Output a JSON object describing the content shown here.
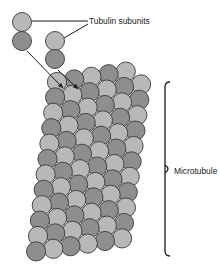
{
  "figure": {
    "title_alt": "Microtubule assembled from tubulin subunits",
    "background": "#ffffff"
  },
  "labels": {
    "tubulin_subunits": "Tubulin subunits",
    "microtubule": "Microtubule"
  },
  "colors": {
    "alpha_subunit": "#b8b8b8",
    "beta_subunit": "#8e8e8e",
    "outline": "#3a3a3a",
    "leader_line": "#1a1a1a",
    "bracket": "#1a1a1a",
    "text": "#1a1a1a"
  },
  "free_subunits": [
    {
      "name": "alpha-subunit-upper-left",
      "shade": "light",
      "cx": 22,
      "cy": 22,
      "r": 9.5
    },
    {
      "name": "beta-subunit-lower-left",
      "shade": "dark",
      "cx": 22,
      "cy": 41,
      "r": 9.5
    },
    {
      "name": "alpha-subunit-upper-middle",
      "shade": "light",
      "cx": 55,
      "cy": 41,
      "r": 9.5
    },
    {
      "name": "beta-subunit-lower-middle",
      "shade": "dark",
      "cx": 55,
      "cy": 59,
      "r": 9.5
    }
  ],
  "leader_lines": [
    {
      "name": "leader-to-left-dimer",
      "x1": 32,
      "y1": 21,
      "x2": 88,
      "y2": 21
    },
    {
      "name": "leader-to-middle-dimer",
      "x1": 64,
      "y1": 38,
      "x2": 88,
      "y2": 24
    }
  ],
  "arrows": [
    {
      "name": "assembly-arrow-left",
      "x1": 27,
      "y1": 51,
      "x2": 63,
      "y2": 88
    },
    {
      "name": "assembly-arrow-middle",
      "x1": 58,
      "y1": 70,
      "x2": 78,
      "y2": 89
    }
  ],
  "bracket": {
    "name": "microtubule-bracket",
    "x": 165,
    "y_top": 82,
    "y_bottom": 256,
    "tick": 5
  },
  "label_positions": {
    "tubulin_subunits": {
      "x": 89,
      "y": 24
    },
    "microtubule": {
      "x": 174,
      "y": 174
    }
  },
  "lattice": {
    "description": "Skewed grid of alternating light and dark tubulin monomers forming the microtubule wall",
    "radius": 9.6,
    "columns": 6,
    "rows": 12,
    "col_dx": 17.2,
    "col_dy": -2.6,
    "row_dx": -1.9,
    "row_dy": 15.4,
    "origin_x": 57,
    "origin_y": 82,
    "shade_rule": "alternating by (row + column) parity; light = alpha, dark = beta"
  }
}
